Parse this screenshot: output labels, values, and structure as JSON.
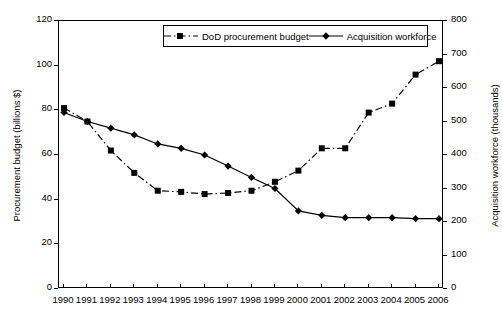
{
  "chart_data": {
    "type": "line",
    "title": "",
    "xlabel": "",
    "ylabel": "Procurement budget (billions $)",
    "y2label": "Acquisition workforce (thousands)",
    "categories": [
      "1990",
      "1991",
      "1992",
      "1993",
      "1994",
      "1995",
      "1996",
      "1997",
      "1998",
      "1999",
      "2000",
      "2001",
      "2002",
      "2003",
      "2004",
      "2005",
      "2006"
    ],
    "xlim": [
      1990,
      2006
    ],
    "ylim": [
      0,
      120
    ],
    "y2lim": [
      0,
      800
    ],
    "yticks": [
      "0",
      "20",
      "40",
      "60",
      "80",
      "100",
      "120"
    ],
    "y2ticks": [
      "0",
      "100",
      "200",
      "300",
      "400",
      "500",
      "600",
      "700",
      "800"
    ],
    "grid": false,
    "legend_position": "top-center",
    "series": [
      {
        "name": "DoD procurement budget",
        "axis": "left",
        "units": "billions $",
        "style": "dashed",
        "marker": "square",
        "color": "#000000",
        "values": [
          81,
          75,
          62,
          52,
          44,
          43.5,
          42.5,
          43,
          44,
          48,
          53,
          63,
          63,
          79,
          83,
          96,
          102
        ]
      },
      {
        "name": "Acquisition workforce",
        "axis": "right",
        "units": "thousands",
        "style": "solid",
        "marker": "diamond",
        "color": "#000000",
        "values": [
          527,
          500,
          480,
          460,
          433,
          420,
          400,
          367,
          333,
          300,
          233,
          220,
          213,
          213,
          213,
          210,
          210
        ]
      }
    ]
  }
}
